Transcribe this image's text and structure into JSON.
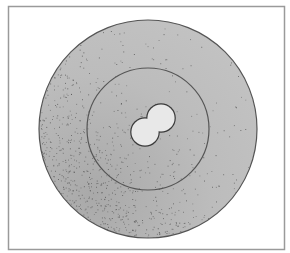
{
  "figure": {
    "frame": {
      "x": 8,
      "y": 6,
      "width": 276,
      "height": 243,
      "stroke": "#9a9a9a"
    },
    "outer_circle": {
      "cx": 148,
      "cy": 129,
      "r": 109,
      "fill": "#bdbdbd",
      "stroke": "#555555"
    },
    "inner_circle": {
      "cx": 148,
      "cy": 129,
      "r": 61,
      "stroke": "#555555"
    },
    "nucleus": {
      "lobes": [
        {
          "cx": 145,
          "cy": 132,
          "r": 14
        },
        {
          "cx": 161,
          "cy": 118,
          "r": 14
        }
      ],
      "fill": "#e8e8e8",
      "stroke": "#3a3a3a"
    },
    "stipple": {
      "color": "#555555",
      "dense_side": "lower-left"
    }
  }
}
